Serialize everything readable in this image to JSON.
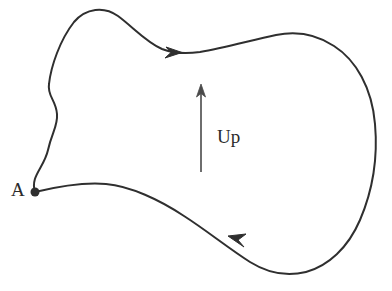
{
  "figure": {
    "kind": "closed-loop-diagram",
    "background_color": "#ffffff",
    "stroke_color": "#2f2f2f",
    "canvas": {
      "width": 392,
      "height": 291
    },
    "labels": {
      "point_a": "A",
      "up_direction": "Up"
    },
    "point_marker": {
      "name": "A",
      "x": 35,
      "y": 192,
      "radius": 4
    },
    "up_arrow": {
      "label": "Up",
      "x": 201,
      "tail_y": 172,
      "tip_y": 85,
      "direction": "up"
    },
    "direction_arrows": [
      {
        "name": "top-arrow",
        "x": 178,
        "y": 52,
        "points": "right"
      },
      {
        "name": "bottom-arrow",
        "x": 232,
        "y": 240,
        "points": "left"
      }
    ],
    "loop_path": "M 35 192 C 30 176 44 168 48 150 C 52 132 58 126 57 114 C 56 100 47 96 49 84 C 51 66 60 40 74 22 C 86 8 104 6 118 16 C 134 28 146 42 162 49 C 172 53 186 54 200 52 C 224 48 252 40 276 35 C 296 31 316 34 334 46 C 356 60 372 88 375 124 C 378 158 372 192 360 220 C 348 248 328 266 306 272 C 286 277 266 272 250 262 C 228 248 206 230 184 216 C 160 200 130 186 106 184 C 84 182 60 186 35 192 Z"
  }
}
